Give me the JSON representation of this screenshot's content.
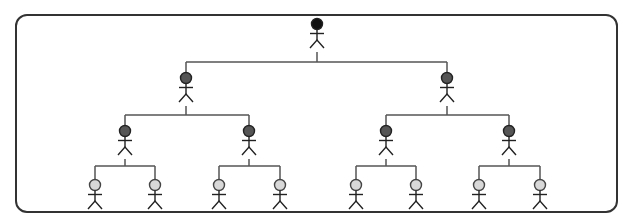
{
  "diagram": {
    "type": "hierarchy-tree",
    "colors": {
      "border": "#333333",
      "line": "#555555",
      "figure_stroke": "#222222",
      "level_1_head": "#111111",
      "level_2_head": "#555555",
      "level_3_head": "#555555",
      "level_4_head": "#d8d8d8"
    },
    "levels": [
      {
        "level": 1,
        "nodes": [
          {
            "id": "n1",
            "x": 317,
            "y": 24
          }
        ]
      },
      {
        "level": 2,
        "nodes": [
          {
            "id": "n2",
            "x": 186,
            "y": 78,
            "parent": "n1"
          },
          {
            "id": "n3",
            "x": 447,
            "y": 78,
            "parent": "n1"
          }
        ]
      },
      {
        "level": 3,
        "nodes": [
          {
            "id": "n4",
            "x": 125,
            "y": 131,
            "parent": "n2"
          },
          {
            "id": "n5",
            "x": 249,
            "y": 131,
            "parent": "n2"
          },
          {
            "id": "n6",
            "x": 386,
            "y": 131,
            "parent": "n3"
          },
          {
            "id": "n7",
            "x": 509,
            "y": 131,
            "parent": "n3"
          }
        ]
      },
      {
        "level": 4,
        "nodes": [
          {
            "id": "n8",
            "x": 95,
            "y": 185,
            "parent": "n4"
          },
          {
            "id": "n9",
            "x": 155,
            "y": 185,
            "parent": "n4"
          },
          {
            "id": "n10",
            "x": 219,
            "y": 185,
            "parent": "n5"
          },
          {
            "id": "n11",
            "x": 280,
            "y": 185,
            "parent": "n5"
          },
          {
            "id": "n12",
            "x": 356,
            "y": 185,
            "parent": "n6"
          },
          {
            "id": "n13",
            "x": 416,
            "y": 185,
            "parent": "n6"
          },
          {
            "id": "n14",
            "x": 479,
            "y": 185,
            "parent": "n7"
          },
          {
            "id": "n15",
            "x": 540,
            "y": 185,
            "parent": "n7"
          }
        ]
      }
    ],
    "connector_y": {
      "1": 62,
      "2": 115,
      "3": 166
    }
  }
}
